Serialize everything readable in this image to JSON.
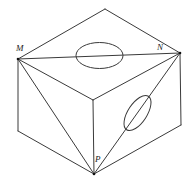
{
  "diagram": {
    "type": "geometry-cube-cross-sections",
    "stroke_color": "#3a3a3a",
    "labels": {
      "M": "M",
      "N": "N",
      "P": "P"
    },
    "vertices": {
      "top_back": [
        105,
        9
      ],
      "M": [
        18,
        59
      ],
      "N": [
        180,
        53
      ],
      "front_top": [
        93,
        100
      ],
      "left_bottom": [
        18,
        131
      ],
      "right_bottom": [
        181,
        125
      ],
      "P": [
        94,
        174
      ]
    },
    "edges": [
      [
        "top_back",
        "M"
      ],
      [
        "top_back",
        "N"
      ],
      [
        "M",
        "front_top"
      ],
      [
        "N",
        "front_top"
      ],
      [
        "M",
        "left_bottom"
      ],
      [
        "N",
        "right_bottom"
      ],
      [
        "front_top",
        "P"
      ],
      [
        "left_bottom",
        "P"
      ],
      [
        "right_bottom",
        "P"
      ]
    ],
    "section_lines": [
      [
        "M",
        "N"
      ],
      [
        "M",
        "P"
      ],
      [
        "N",
        "P"
      ]
    ],
    "ellipses": [
      {
        "name": "top-face-ellipse",
        "cx": 99.5,
        "cy": 55.5,
        "rx": 23.5,
        "ry": 13,
        "rotation": 0
      },
      {
        "name": "right-face-ellipse",
        "cx": 137.5,
        "cy": 113,
        "rx": 20,
        "ry": 9.5,
        "rotation": -57
      }
    ]
  }
}
